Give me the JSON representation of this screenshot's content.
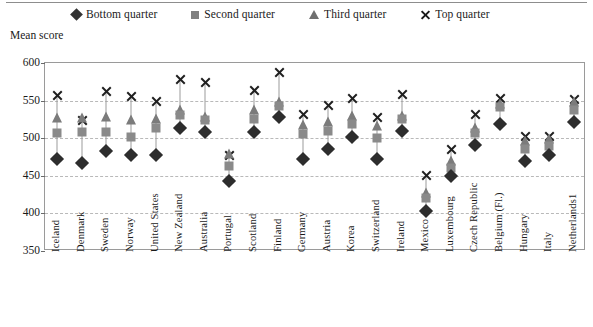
{
  "chart_data": {
    "type": "scatter",
    "title": "",
    "subtitle": "",
    "xlabel": "",
    "ylabel": "Mean score",
    "ylim": [
      350,
      600
    ],
    "ytick_step": 50,
    "yticks": [
      600,
      550,
      500,
      450,
      400,
      350
    ],
    "grid": true,
    "legend_position": "top",
    "legend": [
      "Bottom quarter",
      "Second quarter",
      "Third quarter",
      "Top quarter"
    ],
    "markers": {
      "Bottom quarter": "diamond",
      "Second quarter": "square",
      "Third quarter": "triangle",
      "Top quarter": "cross"
    },
    "categories": [
      "Iceland",
      "Denmark",
      "Sweden",
      "Norway",
      "United States",
      "New Zealand",
      "Australia",
      "Portugal",
      "Scotland",
      "Finland",
      "Germany",
      "Austria",
      "Korea",
      "Switzerland",
      "Ireland",
      "Mexico",
      "Luxembourg",
      "Czech Republic",
      "Belgium (Fl.)",
      "Hungary",
      "Italy",
      "Netherlands1"
    ],
    "series": [
      {
        "name": "Bottom quarter",
        "values": [
          472,
          467,
          483,
          477,
          477,
          513,
          508,
          443,
          508,
          528,
          472,
          485,
          502,
          473,
          509,
          403,
          450,
          491,
          519,
          470,
          478,
          522
        ]
      },
      {
        "name": "Second quarter",
        "values": [
          507,
          508,
          508,
          501,
          514,
          531,
          524,
          463,
          525,
          543,
          505,
          510,
          519,
          500,
          525,
          421,
          461,
          507,
          541,
          486,
          490,
          538
        ]
      },
      {
        "name": "Third quarter",
        "values": [
          527,
          527,
          528,
          524,
          526,
          537,
          528,
          479,
          538,
          548,
          518,
          522,
          529,
          516,
          530,
          427,
          470,
          513,
          545,
          496,
          499,
          548
        ]
      },
      {
        "name": "Top quarter",
        "values": [
          557,
          524,
          562,
          555,
          549,
          578,
          574,
          477,
          564,
          587,
          532,
          544,
          553,
          527,
          558,
          450,
          485,
          532,
          553,
          502,
          502,
          551
        ]
      }
    ]
  },
  "axis_title": "Mean score"
}
